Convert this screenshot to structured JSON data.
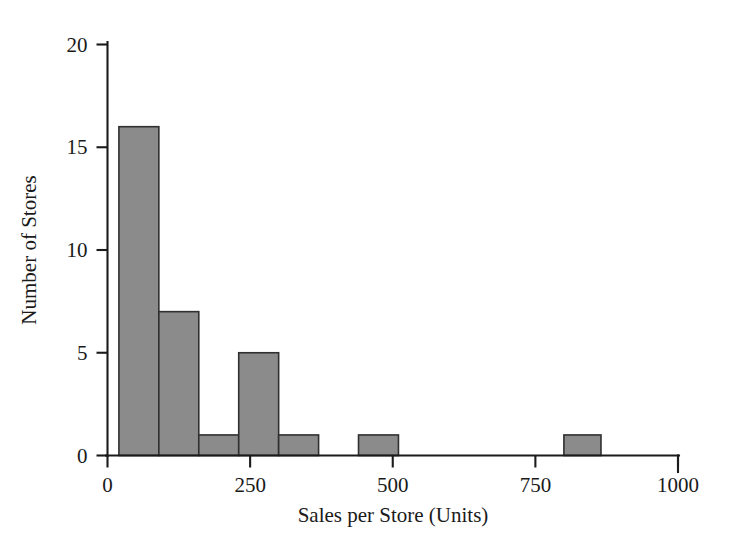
{
  "chart_data": {
    "type": "bar",
    "title": "",
    "subtitle": "",
    "xlabel": "Sales per Store (Units)",
    "ylabel": "Number of Stores",
    "xlim": [
      0,
      1000
    ],
    "ylim": [
      0,
      20
    ],
    "xticks": [
      0,
      250,
      500,
      750,
      1000
    ],
    "xtick_labels": [
      "0",
      "250",
      "500",
      "750",
      "1000"
    ],
    "yticks": [
      0,
      5,
      10,
      15,
      20
    ],
    "ytick_labels": [
      "0",
      "5",
      "10",
      "15",
      "20"
    ],
    "grid": false,
    "legend": null,
    "bar_fill_color": "#8b8b8b",
    "bar_edge_color": "#303030",
    "axis_color": "#1b1b1b",
    "background_color": "#ffffff",
    "bin_width": 70,
    "bars": [
      {
        "label": "20-90",
        "bin_start": 20,
        "bin_end": 90,
        "value": 16
      },
      {
        "label": "90-160",
        "bin_start": 90,
        "bin_end": 160,
        "value": 7
      },
      {
        "label": "160-230",
        "bin_start": 160,
        "bin_end": 230,
        "value": 1
      },
      {
        "label": "230-300",
        "bin_start": 230,
        "bin_end": 300,
        "value": 5
      },
      {
        "label": "300-370",
        "bin_start": 300,
        "bin_end": 370,
        "value": 1
      },
      {
        "label": "370-440",
        "bin_start": 370,
        "bin_end": 440,
        "value": 0
      },
      {
        "label": "440-510",
        "bin_start": 440,
        "bin_end": 510,
        "value": 0
      },
      {
        "label": "510-580",
        "bin_start": 510,
        "bin_end": 580,
        "value": 0
      },
      {
        "label": "580-650",
        "bin_start": 580,
        "bin_end": 650,
        "value": 0
      },
      {
        "label": "650-720",
        "bin_start": 650,
        "bin_end": 720,
        "value": 0
      },
      {
        "label": "720-790",
        "bin_start": 720,
        "bin_end": 790,
        "value": 0
      },
      {
        "label": "790-860",
        "bin_start": 790,
        "bin_end": 860,
        "value": 1
      },
      {
        "label": "860-930",
        "bin_start": 860,
        "bin_end": 930,
        "value": 0
      },
      {
        "label": "930-1000",
        "bin_start": 930,
        "bin_end": 1000,
        "value": 0
      }
    ],
    "bars_drawn": [
      {
        "bin_start": 20,
        "bin_end": 90,
        "value": 16
      },
      {
        "bin_start": 90,
        "bin_end": 160,
        "value": 7
      },
      {
        "bin_start": 160,
        "bin_end": 230,
        "value": 1
      },
      {
        "bin_start": 230,
        "bin_end": 300,
        "value": 5
      },
      {
        "bin_start": 300,
        "bin_end": 370,
        "value": 1
      },
      {
        "bin_start": 440,
        "bin_end": 510,
        "value": 1
      },
      {
        "bin_start": 800,
        "bin_end": 865,
        "value": 1
      }
    ]
  }
}
